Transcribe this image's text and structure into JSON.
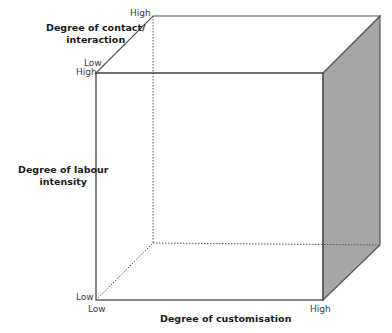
{
  "diagram": {
    "type": "3d-cube",
    "axes": {
      "contact": {
        "title_line1": "Degree of contact/",
        "title_line2": "interaction",
        "low": "Low",
        "high": "High"
      },
      "labour": {
        "title_line1": "Degree of labour",
        "title_line2": "intensity",
        "low": "Low",
        "high": "High"
      },
      "customisation": {
        "title": "Degree of customisation",
        "low": "Low",
        "high": "High"
      }
    },
    "colors": {
      "edge": "#555555",
      "shaded_face": "#a6a6a6",
      "hidden_edge": "#555555"
    }
  }
}
